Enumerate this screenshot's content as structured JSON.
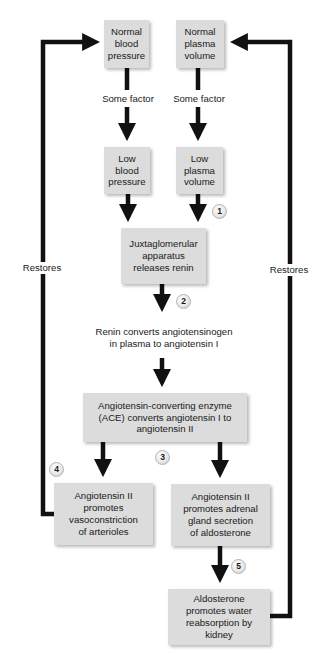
{
  "diagram": {
    "boxes": {
      "normal_bp": "Normal\nblood\npressure",
      "normal_pv": "Normal\nplasma\nvolume",
      "low_bp": "Low\nblood\npressure",
      "low_pv": "Low\nplasma\nvolume",
      "jga": "Juxtaglomerular\napparatus\nreleases renin",
      "ace": "Angiotensin-converting enzyme\n(ACE) converts angiotensin I to\nangiotensin II",
      "vaso": "Angiotensin II\npromotes\nvasoconstriction\nof arterioles",
      "adrenal": "Angiotensin II\npromotes adrenal\ngland secretion\nof aldosterone",
      "aldo": "Aldosterone\npromotes water\nreabsorption by\nkidney"
    },
    "labels": {
      "factor_left": "Some factor",
      "factor_right": "Some factor",
      "renin_step": "Renin converts angiotensinogen\nin plasma to angiotensin I",
      "restores_left": "Restores",
      "restores_right": "Restores"
    },
    "steps": [
      "1",
      "2",
      "3",
      "4",
      "5"
    ],
    "colors": {
      "box_fill": "#dcdcdc",
      "arrow": "#111111",
      "text": "#1a1a1a"
    }
  }
}
